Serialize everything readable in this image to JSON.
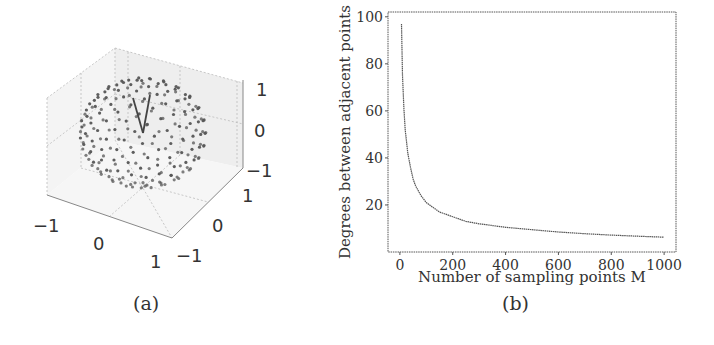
{
  "figure": {
    "captions": {
      "a": "(a)",
      "b": "(b)"
    }
  },
  "chart_data": [
    {
      "id": "a",
      "type": "scatter",
      "title": "",
      "description": "3D scatter of sampling points distributed on a unit sphere, with two vectors drawn from the origin forming a narrow V shape",
      "xlabel": "",
      "ylabel": "",
      "zlabel": "",
      "x_ticks": [
        "−1",
        "0",
        "1"
      ],
      "y_ticks": [
        "−1",
        "0",
        "1"
      ],
      "z_ticks": [
        "−1",
        "0",
        "1"
      ],
      "xlim": [
        -1,
        1
      ],
      "ylim": [
        -1,
        1
      ],
      "zlim": [
        -1,
        1
      ],
      "grid": true,
      "point_color": "#555555"
    },
    {
      "id": "b",
      "type": "line",
      "title": "",
      "xlabel": "Number of sampling points M",
      "ylabel": "Degrees between adjacent points",
      "x_ticks": [
        "0",
        "200",
        "400",
        "600",
        "800",
        "1000"
      ],
      "y_ticks": [
        "20",
        "40",
        "60",
        "80",
        "100"
      ],
      "xlim": [
        -45,
        1045
      ],
      "ylim": [
        0,
        100
      ],
      "grid": false,
      "legend": null,
      "line_color": "#555555",
      "series": [
        {
          "name": "angle",
          "x": [
            6,
            10,
            15,
            20,
            30,
            40,
            50,
            60,
            80,
            100,
            150,
            200,
            250,
            300,
            400,
            500,
            600,
            700,
            800,
            900,
            1000
          ],
          "y": [
            97,
            75,
            61,
            52,
            42,
            36,
            31,
            28,
            24,
            21,
            17,
            15,
            13,
            12,
            10.5,
            9.5,
            8.5,
            7.8,
            7.2,
            6.7,
            6.3
          ]
        }
      ]
    }
  ]
}
